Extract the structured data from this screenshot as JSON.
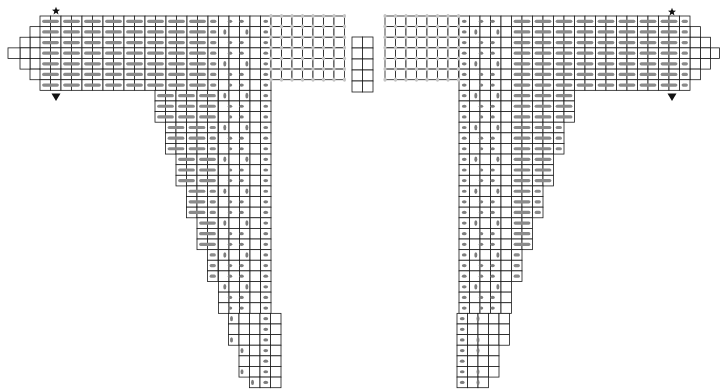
{
  "grid": {
    "cell_width": 10.5,
    "cell_height": 10.62,
    "origin_y": 16,
    "line_color": "#1a1a1a",
    "stitch_color": "#8a8a8a",
    "lace_color": "#c4c4c4",
    "background": "#ffffff"
  },
  "legend": {
    "start_marker": "star-icon",
    "end_marker": "triangle-down-icon"
  },
  "pieces": [
    {
      "name": "left-piece",
      "side": "left",
      "markers": [
        {
          "type": "star",
          "x": 56,
          "y": 11
        },
        {
          "type": "triangle",
          "x": 56,
          "y": 97
        }
      ],
      "top_rows": 7,
      "stub_blocks": [
        {
          "x": 30,
          "w": 10.5,
          "row_start": 1,
          "row_end": 6
        },
        {
          "x": 20,
          "w": 10,
          "row_start": 2,
          "row_end": 5
        },
        {
          "x": 8,
          "w": 12,
          "row_start": 3,
          "row_end": 4
        }
      ],
      "stripe_block": {
        "x": 40,
        "cols": 17,
        "rows": 7
      },
      "cable_block": {
        "x": 218.5,
        "cols": 5,
        "rows": 7
      },
      "lace_block": {
        "x": 271,
        "cols": 7,
        "rows": 6
      },
      "lower": {
        "first_row": 7,
        "last_row": 34,
        "right_edge": 271,
        "start_left": 155,
        "step_every_rows": 3,
        "step_px": 10.5
      }
    },
    {
      "name": "right-piece",
      "side": "right",
      "markers": [
        {
          "type": "star",
          "x": 672,
          "y": 12
        },
        {
          "type": "triangle",
          "x": 672,
          "y": 97
        }
      ],
      "top_rows": 7,
      "stub_blocks": [
        {
          "x": 690,
          "w": 10.5,
          "row_start": 1,
          "row_end": 6
        },
        {
          "x": 700.5,
          "w": 10,
          "row_start": 2,
          "row_end": 5
        },
        {
          "x": 710.5,
          "w": 9,
          "row_start": 3,
          "row_end": 4
        }
      ],
      "stripe_block": {
        "x": 511.5,
        "cols": 17,
        "rows": 7
      },
      "cable_block": {
        "x": 459,
        "cols": 5,
        "rows": 7
      },
      "lace_block": {
        "x": 385,
        "cols": 7,
        "rows": 6
      },
      "lower": {
        "first_row": 7,
        "last_row": 34,
        "left_edge": 457,
        "start_right": 575,
        "step_every_rows": 3,
        "step_px": 10.5
      }
    }
  ],
  "center_block": {
    "name": "center-swatch",
    "x": 352,
    "y": 37,
    "cols": 2,
    "rows": 5,
    "cell_w": 10.5,
    "cell_h": 11
  }
}
